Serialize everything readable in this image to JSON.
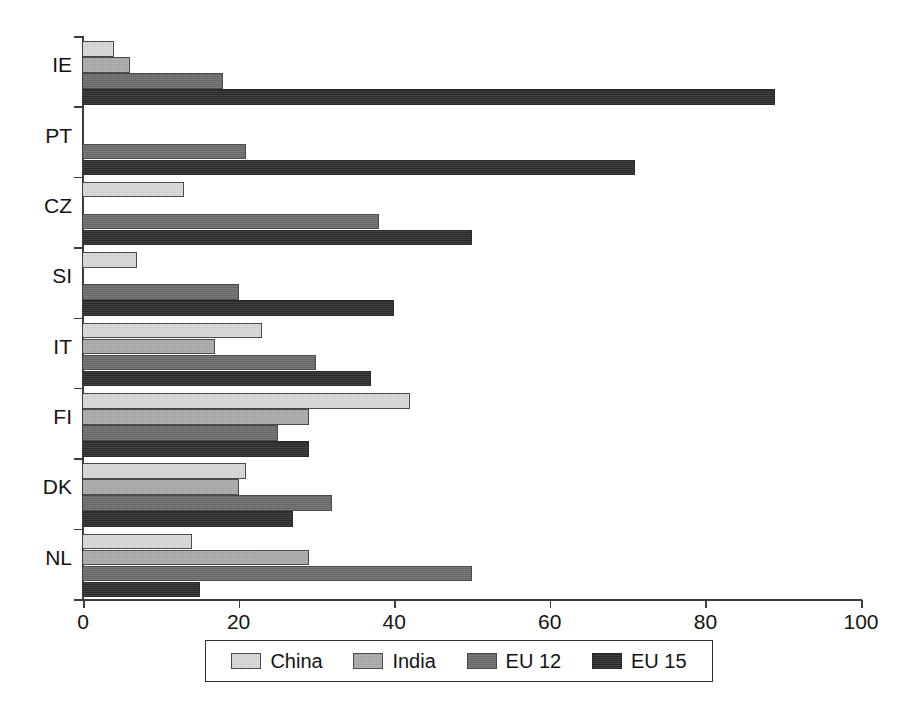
{
  "chart_data": {
    "type": "bar",
    "orientation": "horizontal",
    "title": "",
    "subtitle": "",
    "xlabel": "",
    "ylabel": "",
    "xlim": [
      0,
      100
    ],
    "xticks": [
      0,
      20,
      40,
      60,
      80,
      100
    ],
    "xticklabels": [
      "0",
      "20",
      "40",
      "60",
      "80",
      "100"
    ],
    "grid": false,
    "legend_position": "bottom",
    "categories": [
      "IE",
      "PT",
      "CZ",
      "SI",
      "IT",
      "FI",
      "DK",
      "NL"
    ],
    "series": [
      {
        "name": "China",
        "color": "#d9d9d9",
        "values": [
          4,
          0,
          13,
          7,
          23,
          42,
          21,
          14
        ]
      },
      {
        "name": "India",
        "color": "#ababab",
        "values": [
          6,
          0,
          0,
          0,
          17,
          29,
          20,
          29
        ]
      },
      {
        "name": "EU 12",
        "color": "#6b6b6b",
        "values": [
          18,
          21,
          38,
          20,
          30,
          25,
          32,
          50
        ]
      },
      {
        "name": "EU 15",
        "color": "#2b2b2b",
        "values": [
          89,
          71,
          50,
          40,
          37,
          29,
          27,
          15
        ]
      }
    ]
  },
  "legend": {
    "items": [
      {
        "label": "China"
      },
      {
        "label": "India"
      },
      {
        "label": "EU 12"
      },
      {
        "label": "EU 15"
      }
    ]
  }
}
